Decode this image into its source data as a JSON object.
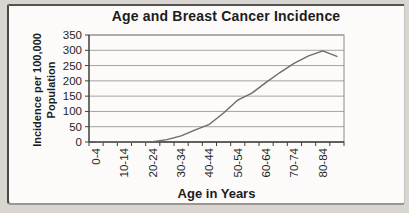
{
  "chart_data": {
    "type": "line",
    "title": "Age and Breast Cancer Incidence",
    "xlabel": "Age in Years",
    "ylabel_lines": [
      "Incidence per 100,000",
      "Population"
    ],
    "categories": [
      "0-4",
      "5-9",
      "10-14",
      "15-19",
      "20-24",
      "25-29",
      "30-34",
      "35-39",
      "40-44",
      "45-49",
      "50-54",
      "55-59",
      "60-64",
      "65-69",
      "70-74",
      "75-79",
      "80-84",
      "85+"
    ],
    "values": [
      0,
      0,
      0,
      0,
      1,
      8,
      20,
      40,
      58,
      95,
      137,
      160,
      195,
      228,
      258,
      282,
      298,
      280
    ],
    "x_label_every": 2,
    "x_tick_labels": [
      "0-4",
      "10-14",
      "20-24",
      "30-34",
      "40-44",
      "50-54",
      "60-64",
      "70-74",
      "80-84"
    ],
    "ylim": [
      0,
      350
    ],
    "ytick_step": 50,
    "ytick_labels": [
      "0",
      "50",
      "100",
      "150",
      "200",
      "250",
      "300",
      "350"
    ],
    "grid": true,
    "legend": "none",
    "colors": {
      "line": "#6b6b6b",
      "grid": "#a3a3a3",
      "axis": "#3f3f3f",
      "plot_border": "#8c8c8c",
      "text": "#1f1f1f"
    }
  }
}
